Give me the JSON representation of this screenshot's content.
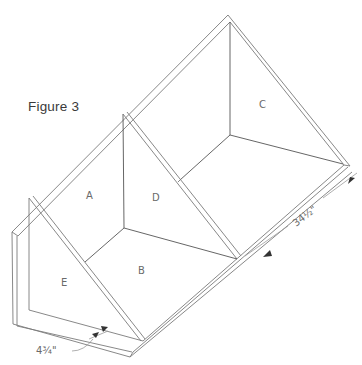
{
  "figure": {
    "title": "Figure 3",
    "panels": [
      {
        "id": "A",
        "label": "A"
      },
      {
        "id": "B",
        "label": "B"
      },
      {
        "id": "C",
        "label": "C"
      },
      {
        "id": "D",
        "label": "D"
      },
      {
        "id": "E",
        "label": "E"
      }
    ],
    "dimensions": [
      {
        "id": "length",
        "label": "34½\""
      },
      {
        "id": "depth",
        "label": "4¾\""
      }
    ],
    "colors": {
      "line": "#7a7a7a",
      "text": "#6a6a6a",
      "background": "#ffffff"
    }
  }
}
